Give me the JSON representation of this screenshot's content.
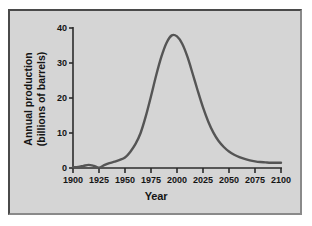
{
  "figure": {
    "background_color": "#ffffff",
    "plot_background_color": "#d5d5d5",
    "border_color": "#4a4a4a",
    "line_color": "#555555",
    "axis_color": "#2b2b2b",
    "text_color": "#141414"
  },
  "labels": {
    "ylabel_line1": "Annual production",
    "ylabel_line2": "(billions of barrels)",
    "xlabel": "Year"
  },
  "chart_data": {
    "type": "line",
    "title": "",
    "subtitle": "",
    "xlabel": "Year",
    "ylabel": "Annual production (billions of barrels)",
    "xlim": [
      1900,
      2100
    ],
    "ylim": [
      0,
      40
    ],
    "xticks": [
      1900,
      1925,
      1950,
      1975,
      2000,
      2025,
      2050,
      2075,
      2100
    ],
    "xtick_labels": [
      "1900",
      "1925",
      "1950",
      "1975",
      "2000",
      "2025",
      "2050",
      "2075",
      "2100"
    ],
    "yticks": [
      0,
      10,
      20,
      30,
      40
    ],
    "ytick_labels": [
      "0",
      "10",
      "20",
      "30",
      "40"
    ],
    "grid": false,
    "legend": null,
    "annotations": [],
    "peak": {
      "x": 1995,
      "y": 38
    },
    "series": [
      {
        "name": "Annual oil production",
        "x": [
          1900,
          1905,
          1910,
          1915,
          1920,
          1925,
          1930,
          1935,
          1940,
          1945,
          1950,
          1955,
          1960,
          1965,
          1970,
          1975,
          1980,
          1985,
          1990,
          1995,
          2000,
          2005,
          2010,
          2015,
          2020,
          2025,
          2030,
          2035,
          2040,
          2045,
          2050,
          2055,
          2060,
          2065,
          2070,
          2075,
          2080,
          2085,
          2090,
          2095,
          2100
        ],
        "values": [
          0.2,
          0.3,
          0.6,
          0.9,
          0.6,
          0.1,
          0.8,
          1.4,
          1.8,
          2.3,
          3.0,
          4.6,
          6.8,
          10.0,
          14.8,
          20.5,
          26.5,
          31.8,
          35.8,
          37.9,
          37.6,
          35.5,
          31.8,
          27.0,
          22.0,
          17.3,
          13.3,
          10.1,
          7.7,
          6.0,
          4.7,
          3.8,
          3.1,
          2.6,
          2.2,
          1.9,
          1.7,
          1.6,
          1.5,
          1.5,
          1.5
        ]
      }
    ]
  }
}
